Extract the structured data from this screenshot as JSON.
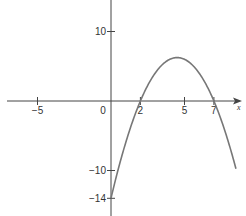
{
  "chart_data": {
    "type": "line",
    "title": "",
    "xlabel": "x",
    "ylabel": "",
    "function": "y = -(x-2)(x-7) = -x^2 + 9x - 14",
    "x_ticks": [
      -5,
      0,
      2,
      5,
      7
    ],
    "y_ticks": [
      10,
      -10,
      -14
    ],
    "x_tick_labels": [
      "−5",
      "0",
      "2",
      "5",
      "7"
    ],
    "y_tick_labels": [
      "10",
      "−10",
      "−14"
    ],
    "roots": [
      2,
      7
    ],
    "vertex": {
      "x": 4.5,
      "y": 6.25
    },
    "y_intercept": -14,
    "xlim": [
      -7.1,
      8.8
    ],
    "ylim": [
      -16,
      14.5
    ],
    "grid": false,
    "series": [
      {
        "name": "parabola",
        "color": "#777777",
        "x": [
          0,
          1,
          2,
          3,
          4,
          4.5,
          5,
          6,
          7,
          8,
          8.5
        ],
        "y": [
          -14,
          -6,
          0,
          4,
          6,
          6.25,
          6,
          4,
          0,
          -6,
          -9.75
        ]
      }
    ]
  },
  "colors": {
    "axis": "#444444",
    "curve": "#777777",
    "text": "#333333"
  }
}
